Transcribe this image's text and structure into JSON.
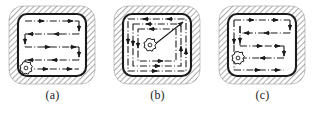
{
  "figure": {
    "type": "technical-diagram",
    "background_color": "#ffffff",
    "line_color": "#1a1a1a",
    "hatch_color": "#555555",
    "panel_count": 3
  },
  "panels": [
    {
      "id": "a",
      "caption": "(a)",
      "strategy_name": "zigzag",
      "tool_position": "bottom-left",
      "pass_count": 4,
      "arrow_count": 8
    },
    {
      "id": "b",
      "caption": "(b)",
      "strategy_name": "contour-parallel",
      "tool_position": "center",
      "pass_count": 3,
      "arrow_count": 12
    },
    {
      "id": "c",
      "caption": "(c)",
      "strategy_name": "spiral-zigzag",
      "tool_position": "bottom-left",
      "pass_count": 4,
      "arrow_count": 8
    }
  ],
  "geometry": {
    "pocket": {
      "x": 18,
      "y": 14,
      "width": 68,
      "height": 62,
      "corner_radius": 9,
      "border_width": 2.1
    },
    "hatch": {
      "x": 9,
      "y": 6,
      "width": 86,
      "height": 78,
      "corner_radius": 14,
      "angle_degrees": 45,
      "spacing": 4
    }
  }
}
